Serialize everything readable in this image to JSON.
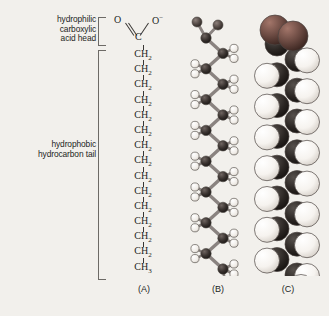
{
  "figure": {
    "background_color": "#f2f0ec",
    "text_color": "#231f1d"
  },
  "labels": {
    "head": "hydrophilic\ncarboxylic\nacid head",
    "head_lines": [
      "hydrophilic",
      "carboxylic",
      "acid head"
    ],
    "tail": "hydrophobic\nhydrocarbon tail",
    "tail_lines": [
      "hydrophobic",
      "hydrocarbon tail"
    ]
  },
  "captions": {
    "a": "(A)",
    "b": "(B)",
    "c": "(C)"
  },
  "structure": {
    "carboxyl": {
      "oxygen_double": "O",
      "oxygen_single": "O",
      "oxygen_single_charge": "−",
      "carbon": "C"
    },
    "chain_units": [
      "CH2",
      "CH2",
      "CH2",
      "CH2",
      "CH2",
      "CH2",
      "CH2",
      "CH2",
      "CH2",
      "CH2",
      "CH2",
      "CH2",
      "CH2",
      "CH2"
    ],
    "chain_unit_label": "CH",
    "chain_unit_sub": "2",
    "terminal_label": "CH",
    "terminal_sub": "3",
    "terminal": "CH3",
    "ch2_count": 14,
    "total_carbons": 16
  },
  "models": {
    "ball_and_stick": {
      "name": "ball-and-stick-model",
      "carbon_color": "#3a3330",
      "hydrogen_color": "#fbfaf8",
      "oxygen_color": "#5c524e",
      "bond_color": "#7d7672",
      "carbon_count": 16
    },
    "space_filling": {
      "name": "space-filling-model",
      "oxygen_color": "#6b4a42",
      "hydrogen_color": "#fcfbf8",
      "carbon_color": "#2e2a27",
      "outline_color": "#4a4440"
    }
  }
}
